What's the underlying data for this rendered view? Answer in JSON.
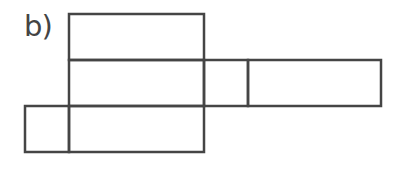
{
  "figure": {
    "label": "b)",
    "line_color": "#454545",
    "line_width": 2.5
  },
  "shapes": [
    {
      "name": "top-rectangle",
      "x": 69,
      "y": 14,
      "w": 135,
      "h": 46
    },
    {
      "name": "middle-left-rectangle",
      "x": 69,
      "y": 60,
      "w": 135,
      "h": 46
    },
    {
      "name": "middle-small-square",
      "x": 204,
      "y": 60,
      "w": 44,
      "h": 46
    },
    {
      "name": "middle-right-rectangle",
      "x": 248,
      "y": 60,
      "w": 133,
      "h": 46
    },
    {
      "name": "bottom-small-square",
      "x": 25,
      "y": 106,
      "w": 44,
      "h": 46
    },
    {
      "name": "bottom-rectangle",
      "x": 69,
      "y": 106,
      "w": 135,
      "h": 46
    }
  ]
}
